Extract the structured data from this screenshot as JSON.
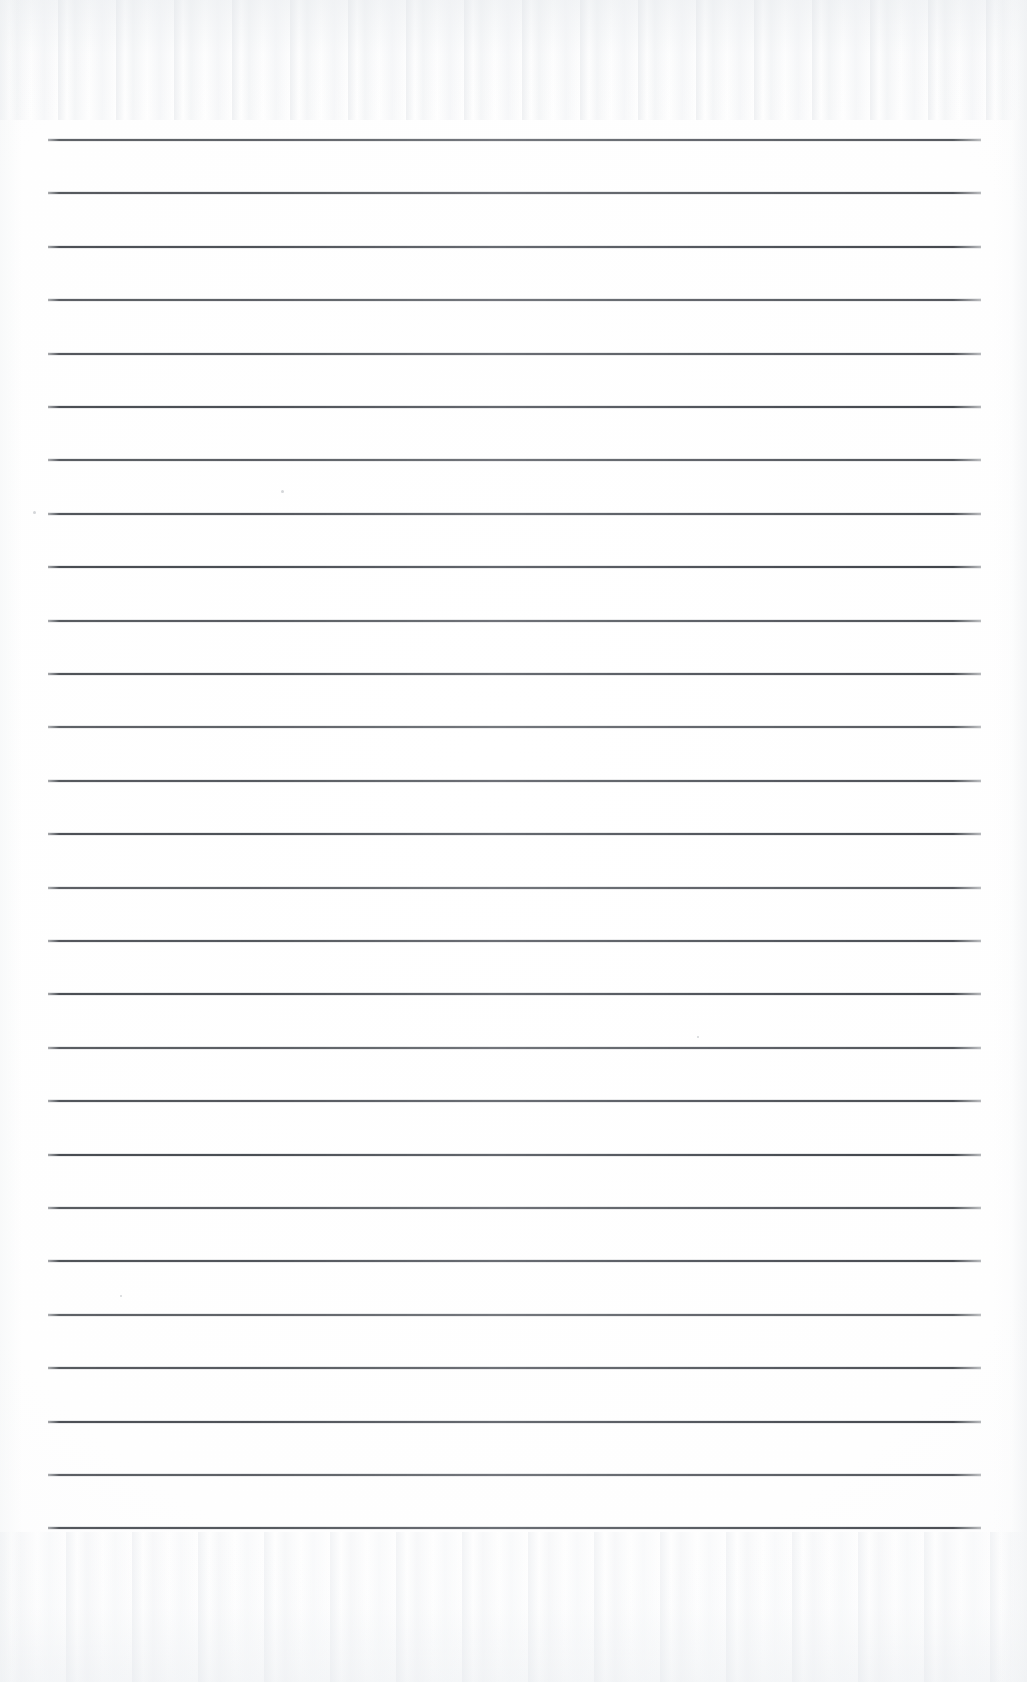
{
  "document": {
    "type": "scanned-ruled-paper",
    "title": "Blank Ruled Notebook Page",
    "page_width": 1027,
    "page_height": 1682,
    "background_color": "#fefefe",
    "has_text": false,
    "has_handwriting": false,
    "orientation": "portrait"
  },
  "ruling": {
    "line_color": "#4a4e54",
    "line_thickness_px": 2,
    "line_count": 27,
    "line_left_x": 48,
    "line_right_x": 981,
    "line_width_px": 933,
    "first_line_y": 139,
    "last_line_y": 1527,
    "line_spacing_px": 53.4,
    "top_margin_px": 139,
    "bottom_margin_px": 155,
    "left_margin_px": 48,
    "right_margin_px": 46,
    "vertical_margin_rule": false,
    "line_y_positions": [
      139,
      192.4,
      245.8,
      299.2,
      352.6,
      406,
      459.4,
      512.8,
      566.2,
      619.6,
      673,
      726.4,
      779.8,
      833.2,
      886.6,
      940,
      993.4,
      1046.8,
      1100.2,
      1153.6,
      1207,
      1260.4,
      1313.8,
      1367.2,
      1420.6,
      1474,
      1527.4
    ]
  },
  "scan_artifacts": {
    "top_band_noise": true,
    "bottom_band_noise": true,
    "right_edge_shading": true,
    "left_edge_shading": true,
    "specks": [
      {
        "x": 33,
        "y": 511,
        "size": 3
      },
      {
        "x": 281,
        "y": 490,
        "size": 3
      },
      {
        "x": 120,
        "y": 1295,
        "size": 2
      },
      {
        "x": 697,
        "y": 1036,
        "size": 2
      }
    ]
  }
}
